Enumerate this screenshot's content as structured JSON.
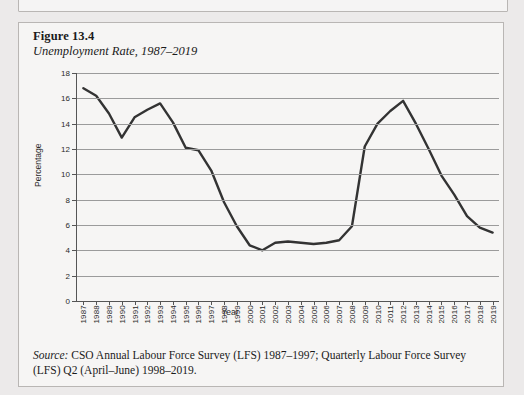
{
  "figure": {
    "number": "Figure 13.4",
    "title": "Unemployment Rate, 1987–2019",
    "source_label": "Source:",
    "source_text": " CSO Annual Labour Force Survey (LFS) 1987–1997; Quarterly Labour Force Survey (LFS) Q2 (April–June) 1998–2019."
  },
  "colors": {
    "page_background": "#eceaea",
    "panel_background": "#f6f5f4",
    "panel_border": "#b9b6b4",
    "line": "#333333",
    "gridline": "#9b9b9b",
    "axis": "#555555",
    "text": "#1b1b1b"
  },
  "chart_data": {
    "type": "line",
    "title": "Unemployment Rate, 1987–2019",
    "xlabel": "Year",
    "ylabel": "Percentage",
    "ylim": [
      0,
      18
    ],
    "ytick_values": [
      0,
      2,
      4,
      6,
      8,
      10,
      12,
      14,
      16,
      18
    ],
    "ytick_labels": [
      "0",
      "2",
      "4",
      "6",
      "8",
      "10",
      "12",
      "14",
      "16",
      "18"
    ],
    "grid": true,
    "legend": "none",
    "categories": [
      "1987",
      "1988",
      "1989",
      "1990",
      "1991",
      "1992",
      "1993",
      "1994",
      "1995",
      "1996",
      "1997",
      "1998",
      "1999",
      "2000",
      "2001",
      "2002",
      "2003",
      "2004",
      "2005",
      "2006",
      "2007",
      "2008",
      "2009",
      "2010",
      "2011",
      "2012",
      "2013",
      "2014",
      "2015",
      "2016",
      "2017",
      "2018",
      "2019"
    ],
    "x": [
      1987,
      1988,
      1989,
      1990,
      1991,
      1992,
      1993,
      1994,
      1995,
      1996,
      1997,
      1998,
      1999,
      2000,
      2001,
      2002,
      2003,
      2004,
      2005,
      2006,
      2007,
      2008,
      2009,
      2010,
      2011,
      2012,
      2013,
      2014,
      2015,
      2016,
      2017,
      2018,
      2019
    ],
    "values": [
      16.8,
      16.2,
      14.8,
      12.9,
      14.5,
      15.1,
      15.6,
      14.1,
      12.1,
      11.9,
      10.3,
      7.8,
      5.9,
      4.4,
      4.0,
      4.6,
      4.7,
      4.6,
      4.5,
      4.6,
      4.8,
      5.9,
      12.2,
      14.0,
      15.0,
      15.8,
      14.0,
      12.0,
      9.9,
      8.4,
      6.7,
      5.8,
      5.4
    ],
    "value_unit": "percent"
  }
}
